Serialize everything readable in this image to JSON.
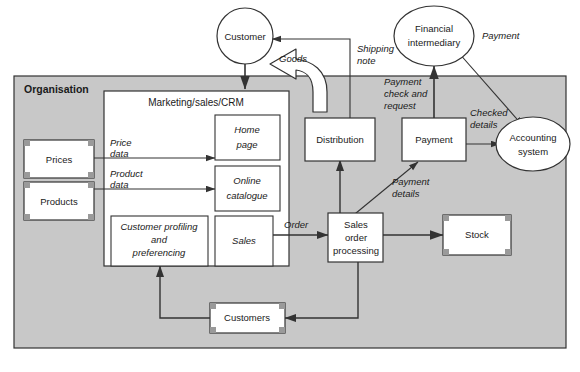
{
  "diagram": {
    "boundary_label": "Organisation",
    "colors": {
      "boundary_fill": "#c8c8c8",
      "node_fill": "#ffffff",
      "stroke": "#333333",
      "handle_fill": "#9a9a9a",
      "text": "#1a1a1a"
    },
    "external_entities": [
      {
        "id": "customer",
        "label": "Customer",
        "shape": "circle"
      },
      {
        "id": "financial-intermediary",
        "label": "Financial\nintermediary",
        "line1": "Financial",
        "line2": "intermediary",
        "shape": "ellipse"
      }
    ],
    "group": {
      "id": "marketing-sales-crm",
      "label": "Marketing/sales/CRM"
    },
    "processes": [
      {
        "id": "home-page",
        "label": "Home page",
        "line1": "Home",
        "line2": "page",
        "italic": true
      },
      {
        "id": "online-catalogue",
        "label": "Online catalogue",
        "line1": "Online",
        "line2": "catalogue",
        "italic": true
      },
      {
        "id": "customer-profiling",
        "label": "Customer profiling and preferencing",
        "line1": "Customer profiling",
        "line2": "and",
        "line3": "preferencing",
        "italic": true
      },
      {
        "id": "sales",
        "label": "Sales",
        "line1": "Sales",
        "italic": true
      },
      {
        "id": "distribution",
        "label": "Distribution",
        "line1": "Distribution",
        "italic": false
      },
      {
        "id": "payment",
        "label": "Payment",
        "line1": "Payment",
        "italic": false
      },
      {
        "id": "sales-order-processing",
        "label": "Sales order processing",
        "line1": "Sales",
        "line2": "order",
        "line3": "processing",
        "italic": false
      },
      {
        "id": "accounting-system",
        "label": "Accounting system",
        "line1": "Accounting",
        "line2": "system",
        "shape": "ellipse"
      }
    ],
    "data_stores": [
      {
        "id": "prices",
        "label": "Prices"
      },
      {
        "id": "products",
        "label": "Products"
      },
      {
        "id": "customers",
        "label": "Customers"
      },
      {
        "id": "stock",
        "label": "Stock"
      }
    ],
    "flows": [
      {
        "id": "price-data",
        "label": "Price data",
        "line1": "Price",
        "line2": "data"
      },
      {
        "id": "product-data",
        "label": "Product data",
        "line1": "Product",
        "line2": "data"
      },
      {
        "id": "order",
        "label": "Order",
        "line1": "Order"
      },
      {
        "id": "goods",
        "label": "Goods",
        "line1": "Goods",
        "style": "block-arrow"
      },
      {
        "id": "shipping-note",
        "label": "Shipping note",
        "line1": "Shipping",
        "line2": "note"
      },
      {
        "id": "payment-check-and-request",
        "label": "Payment check and request",
        "line1": "Payment",
        "line2": "check and",
        "line3": "request"
      },
      {
        "id": "payment",
        "label": "Payment",
        "line1": "Payment"
      },
      {
        "id": "checked-details",
        "label": "Checked details",
        "line1": "Checked",
        "line2": "details"
      },
      {
        "id": "payment-details",
        "label": "Payment details",
        "line1": "Payment",
        "line2": "details"
      }
    ]
  }
}
